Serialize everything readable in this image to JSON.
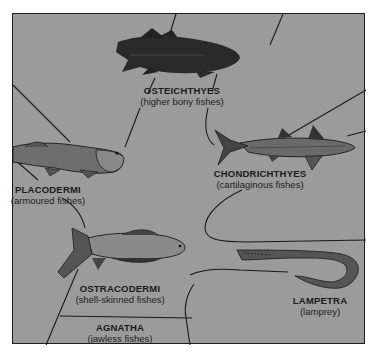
{
  "diagram": {
    "type": "evolutionary-tree",
    "background_color": "#9b9b9b",
    "line_color": "#1a1a1a",
    "groups": [
      {
        "id": "osteichthyes",
        "name": "OSTEICHTHYES",
        "common": "(higher bony fishes)"
      },
      {
        "id": "placodermi",
        "name": "PLACODERMI",
        "common": "(armoured fishes)"
      },
      {
        "id": "chondrichthyes",
        "name": "CHONDRICHTHYES",
        "common": "(cartilaginous fishes)"
      },
      {
        "id": "ostracodermi",
        "name": "OSTRACODERMI",
        "common": "(shell-skinned fishes)"
      },
      {
        "id": "lampetra",
        "name": "LAMPETRA",
        "common": "(lamprey)"
      },
      {
        "id": "agnatha",
        "name": "AGNATHA",
        "common": "(jawless fishes)"
      }
    ]
  }
}
